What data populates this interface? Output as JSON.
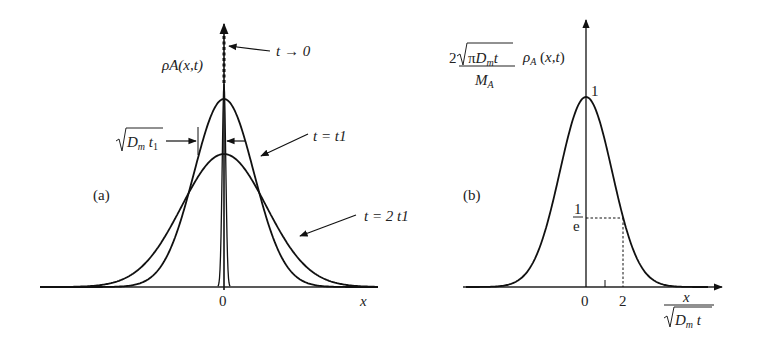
{
  "figure": {
    "panel_a": {
      "tag": "(a)",
      "y_label": "ρA(x,t)",
      "x_label": "x",
      "origin_label": "0",
      "annotations": {
        "t_zero": "t → 0",
        "t_one": "t = t1",
        "t_two": "t = 2 t1",
        "width": "√(Dm t1)"
      },
      "curves": [
        {
          "name": "t → 0",
          "relative_width": 0.05,
          "style": "dotted spike"
        },
        {
          "name": "t = t1",
          "relative_width": 1.0,
          "relative_peak": 1.0
        },
        {
          "name": "t = 2 t1",
          "relative_width": 1.414,
          "relative_peak": 0.707
        }
      ]
    },
    "panel_b": {
      "tag": "(b)",
      "y_label_numerator": "2√(πDm t)",
      "y_label_denominator": "MA",
      "y_label_suffix": "ρA (x,t)",
      "x_label_numerator": "x",
      "x_label_denominator": "√(Dm t)",
      "peak_label": "1",
      "level_label_num": "1",
      "level_label_den": "e",
      "tick_labels": [
        "0",
        "2"
      ],
      "curve": {
        "formula": "exp(-u^2/4)",
        "peak": 1,
        "value_at_2": 0.368
      }
    }
  }
}
